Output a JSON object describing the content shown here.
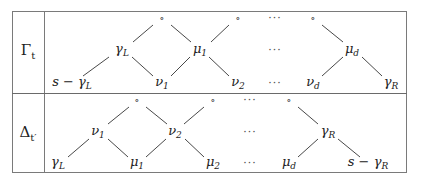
{
  "diagram": {
    "rows": [
      {
        "label": "Γ",
        "label_sub": "t",
        "nodes": [
          {
            "id": "g_top1",
            "text": "∘",
            "sub": "",
            "x": 162,
            "y": 18,
            "kind": "circ"
          },
          {
            "id": "g_top2",
            "text": "∘",
            "sub": "",
            "x": 238,
            "y": 18,
            "kind": "circ"
          },
          {
            "id": "g_topdots",
            "text": "···",
            "sub": "",
            "x": 275,
            "y": 18,
            "kind": "dots"
          },
          {
            "id": "g_top3",
            "text": "∘",
            "sub": "",
            "x": 313,
            "y": 18,
            "kind": "circ"
          },
          {
            "id": "g_gammaL",
            "text": "γ",
            "sub": "L",
            "x": 122,
            "y": 50,
            "kind": "math"
          },
          {
            "id": "g_mu1",
            "text": "μ",
            "sub": "1",
            "x": 200,
            "y": 50,
            "kind": "math"
          },
          {
            "id": "g_middots",
            "text": "···",
            "sub": "",
            "x": 275,
            "y": 50,
            "kind": "dots"
          },
          {
            "id": "g_mud",
            "text": "μ",
            "sub": "d",
            "x": 352,
            "y": 50,
            "kind": "math"
          },
          {
            "id": "g_sgammaL",
            "text": "s − γ",
            "sub": "L",
            "x": 72,
            "y": 83,
            "kind": "math"
          },
          {
            "id": "g_nu1",
            "text": "ν",
            "sub": "1",
            "x": 162,
            "y": 83,
            "kind": "math"
          },
          {
            "id": "g_nu2",
            "text": "ν",
            "sub": "2",
            "x": 238,
            "y": 83,
            "kind": "math"
          },
          {
            "id": "g_botdots",
            "text": "···",
            "sub": "",
            "x": 275,
            "y": 83,
            "kind": "dots"
          },
          {
            "id": "g_nud",
            "text": "ν",
            "sub": "d",
            "x": 313,
            "y": 83,
            "kind": "math"
          },
          {
            "id": "g_gammaR",
            "text": "γ",
            "sub": "R",
            "x": 391,
            "y": 83,
            "kind": "math"
          }
        ],
        "edges": [
          [
            109,
            57,
            83,
            76
          ],
          [
            133,
            42,
            153,
            25
          ],
          [
            132,
            57,
            153,
            76
          ],
          [
            171,
            25,
            191,
            42
          ],
          [
            190,
            57,
            171,
            76
          ],
          [
            209,
            57,
            229,
            76
          ],
          [
            229,
            25,
            211,
            42
          ],
          [
            322,
            25,
            343,
            42
          ],
          [
            343,
            57,
            322,
            76
          ],
          [
            362,
            57,
            382,
            76
          ]
        ]
      },
      {
        "label": "Δ",
        "label_sub": "t′",
        "nodes": [
          {
            "id": "d_top1",
            "text": "∘",
            "sub": "",
            "x": 137,
            "y": 100,
            "kind": "circ"
          },
          {
            "id": "d_top2",
            "text": "∘",
            "sub": "",
            "x": 213,
            "y": 100,
            "kind": "circ"
          },
          {
            "id": "d_topdots",
            "text": "···",
            "sub": "",
            "x": 250,
            "y": 100,
            "kind": "dots"
          },
          {
            "id": "d_top3",
            "text": "∘",
            "sub": "",
            "x": 289,
            "y": 100,
            "kind": "circ"
          },
          {
            "id": "d_nu1",
            "text": "ν",
            "sub": "1",
            "x": 98,
            "y": 132,
            "kind": "math"
          },
          {
            "id": "d_nu2",
            "text": "ν",
            "sub": "2",
            "x": 175,
            "y": 132,
            "kind": "math"
          },
          {
            "id": "d_middots",
            "text": "···",
            "sub": "",
            "x": 250,
            "y": 132,
            "kind": "dots"
          },
          {
            "id": "d_gammaR",
            "text": "γ",
            "sub": "R",
            "x": 328,
            "y": 132,
            "kind": "math"
          },
          {
            "id": "d_gammaL",
            "text": "γ",
            "sub": "L",
            "x": 58,
            "y": 163,
            "kind": "math"
          },
          {
            "id": "d_mu1",
            "text": "μ",
            "sub": "1",
            "x": 137,
            "y": 163,
            "kind": "math"
          },
          {
            "id": "d_mu2",
            "text": "μ",
            "sub": "2",
            "x": 213,
            "y": 163,
            "kind": "math"
          },
          {
            "id": "d_botdots",
            "text": "···",
            "sub": "",
            "x": 250,
            "y": 163,
            "kind": "dots"
          },
          {
            "id": "d_mud",
            "text": "μ",
            "sub": "d",
            "x": 289,
            "y": 163,
            "kind": "math"
          },
          {
            "id": "d_sgammaR",
            "text": "s − γ",
            "sub": "R",
            "x": 368,
            "y": 163,
            "kind": "math"
          }
        ],
        "edges": [
          [
            89,
            139,
            68,
            157
          ],
          [
            108,
            124,
            129,
            107
          ],
          [
            108,
            139,
            128,
            157
          ],
          [
            146,
            107,
            167,
            124
          ],
          [
            166,
            139,
            146,
            157
          ],
          [
            185,
            139,
            204,
            157
          ],
          [
            204,
            107,
            184,
            124
          ],
          [
            298,
            107,
            318,
            124
          ],
          [
            318,
            139,
            298,
            157
          ],
          [
            338,
            139,
            360,
            157
          ]
        ]
      }
    ]
  }
}
